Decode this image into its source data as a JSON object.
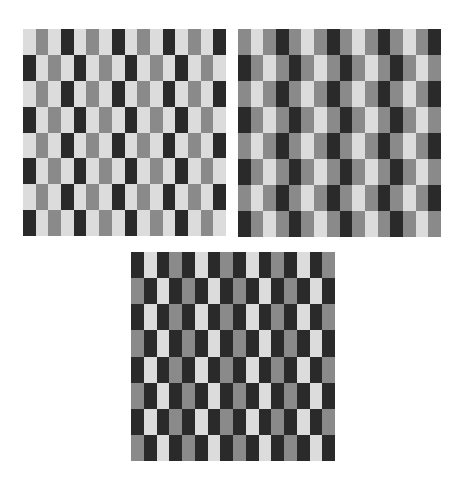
{
  "figure": {
    "colors": {
      "L": "#dcdcdc",
      "M": "#8a8a8a",
      "D": "#2a2a2a"
    },
    "grids": [
      {
        "id": "grid-1",
        "columns": 16,
        "rows": 8,
        "row_patterns": [
          "LMLDLMLDLMLDLMLD",
          "DLMLDLMLDLMLDLML"
        ]
      },
      {
        "id": "grid-2",
        "columns": 16,
        "rows": 8,
        "row_patterns": [
          "MLMDMLMDMLMDMLMD",
          "DMLMDMLMDMLMDMLM"
        ]
      },
      {
        "id": "grid-3",
        "columns": 16,
        "rows": 8,
        "row_patterns": [
          "DLDMDLDMDLDMDLDM",
          "MDLDMDLDMDLDMDLD"
        ]
      }
    ]
  }
}
